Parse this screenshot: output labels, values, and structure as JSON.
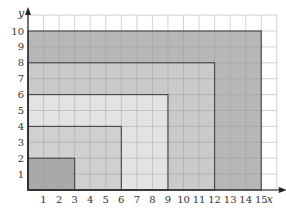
{
  "chart_data": {
    "type": "diagram",
    "title": "",
    "xlabel": "x",
    "ylabel": "y",
    "xlim": [
      0,
      16
    ],
    "ylim": [
      0,
      11
    ],
    "grid": true,
    "x_ticks": [
      "1",
      "2",
      "3",
      "4",
      "5",
      "6",
      "7",
      "8",
      "9",
      "10",
      "11",
      "12",
      "13",
      "14",
      "15"
    ],
    "y_ticks": [
      "1",
      "2",
      "3",
      "4",
      "5",
      "6",
      "7",
      "8",
      "9",
      "10"
    ],
    "rectangles": [
      {
        "name": "rect-15x10",
        "width": 15,
        "height": 10,
        "fill": "#b7b7b7"
      },
      {
        "name": "rect-12x8",
        "width": 12,
        "height": 8,
        "fill": "#cacaca"
      },
      {
        "name": "rect-9x6",
        "width": 9,
        "height": 6,
        "fill": "#e3e3e3"
      },
      {
        "name": "rect-6x4",
        "width": 6,
        "height": 4,
        "fill": "#d0d0d0"
      },
      {
        "name": "rect-3x2",
        "width": 3,
        "height": 2,
        "fill": "#a9a9a9"
      }
    ]
  }
}
